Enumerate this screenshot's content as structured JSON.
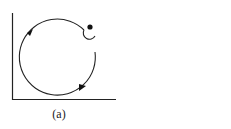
{
  "figure": {
    "caption": "(a)",
    "colors": {
      "stroke": "#222222",
      "background": "#ffffff"
    }
  }
}
